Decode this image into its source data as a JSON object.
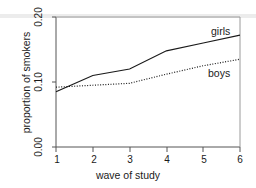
{
  "chart_data": {
    "type": "line",
    "title": "",
    "xlabel": "wave of study",
    "ylabel": "proportion of smokers",
    "x": [
      1,
      2,
      3,
      4,
      5,
      6
    ],
    "xticklabels": [
      "1",
      "2",
      "3",
      "4",
      "5",
      "6"
    ],
    "yticks": [
      0.0,
      0.1,
      0.2
    ],
    "yticklabels": [
      "0.00",
      "0.10",
      "0.20"
    ],
    "xlim": [
      1,
      6
    ],
    "ylim": [
      0.0,
      0.2
    ],
    "grid": false,
    "legend_position": "inline-right-of-series",
    "series": [
      {
        "name": "girls",
        "label": "girls",
        "linestyle": "solid",
        "color": "#1a1a1a",
        "values": [
          0.085,
          0.11,
          0.12,
          0.148,
          0.16,
          0.172
        ]
      },
      {
        "name": "boys",
        "label": "boys",
        "linestyle": "dotted",
        "color": "#1a1a1a",
        "values": [
          0.092,
          0.095,
          0.098,
          0.112,
          0.125,
          0.135
        ]
      }
    ]
  },
  "axes": {
    "ylabel": "proportion of smokers",
    "xlabel": "wave of study",
    "ytick_0": "0.20",
    "ytick_1": "0.10",
    "ytick_2": "0.00",
    "xtick_0": "1",
    "xtick_1": "2",
    "xtick_2": "3",
    "xtick_3": "4",
    "xtick_4": "5",
    "xtick_5": "6"
  },
  "labels": {
    "girls": "girls",
    "boys": "boys"
  },
  "colors": {
    "line": "#1a1a1a",
    "axis": "#555555",
    "background": "#ffffff"
  }
}
